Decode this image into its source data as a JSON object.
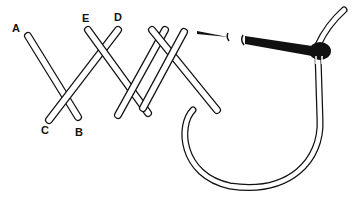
{
  "diagram": {
    "labels": {
      "a": "A",
      "b": "B",
      "c": "C",
      "d": "D",
      "e": "E"
    },
    "colors": {
      "line": "#111111",
      "fill": "#ffffff",
      "needle": "#111111"
    }
  }
}
